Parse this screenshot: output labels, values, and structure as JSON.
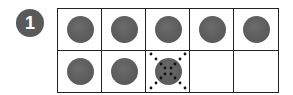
{
  "problem": {
    "number": "1",
    "badge_color": "#5a5a5a"
  },
  "ten_frame": {
    "rows": 2,
    "columns": 5,
    "cells": [
      {
        "row": 0,
        "col": 0,
        "state": "counter"
      },
      {
        "row": 0,
        "col": 1,
        "state": "counter"
      },
      {
        "row": 0,
        "col": 2,
        "state": "counter"
      },
      {
        "row": 0,
        "col": 3,
        "state": "counter"
      },
      {
        "row": 0,
        "col": 4,
        "state": "counter"
      },
      {
        "row": 1,
        "col": 0,
        "state": "counter"
      },
      {
        "row": 1,
        "col": 1,
        "state": "counter"
      },
      {
        "row": 1,
        "col": 2,
        "state": "crossed-out-counter"
      },
      {
        "row": 1,
        "col": 3,
        "state": "empty"
      },
      {
        "row": 1,
        "col": 4,
        "state": "empty"
      }
    ],
    "counter_color": "#5e5e5e",
    "grid_color": "#222222"
  }
}
